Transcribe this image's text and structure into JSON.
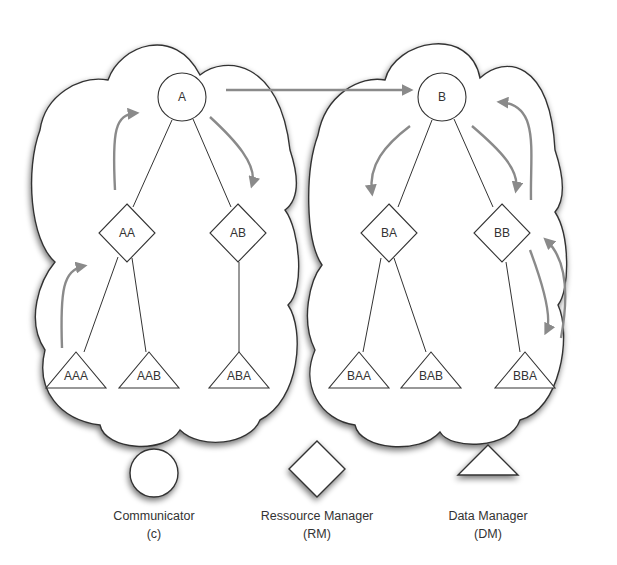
{
  "diagram": {
    "title": "",
    "clusters": [
      {
        "id": "cluster-A",
        "root": "A"
      },
      {
        "id": "cluster-B",
        "root": "B"
      }
    ],
    "nodes": [
      {
        "id": "A",
        "label": "A",
        "type": "communicator",
        "x": 182,
        "y": 97
      },
      {
        "id": "B",
        "label": "B",
        "type": "communicator",
        "x": 442,
        "y": 97
      },
      {
        "id": "AA",
        "label": "AA",
        "type": "resource-manager",
        "x": 127,
        "y": 233
      },
      {
        "id": "AB",
        "label": "AB",
        "type": "resource-manager",
        "x": 238,
        "y": 233
      },
      {
        "id": "BA",
        "label": "BA",
        "type": "resource-manager",
        "x": 389,
        "y": 233
      },
      {
        "id": "BB",
        "label": "BB",
        "type": "resource-manager",
        "x": 502,
        "y": 233
      },
      {
        "id": "AAA",
        "label": "AAA",
        "type": "data-manager",
        "x": 76,
        "y": 375
      },
      {
        "id": "AAB",
        "label": "AAB",
        "type": "data-manager",
        "x": 149,
        "y": 375
      },
      {
        "id": "ABA",
        "label": "ABA",
        "type": "data-manager",
        "x": 239,
        "y": 375
      },
      {
        "id": "BAA",
        "label": "BAA",
        "type": "data-manager",
        "x": 359,
        "y": 375
      },
      {
        "id": "BAB",
        "label": "BAB",
        "type": "data-manager",
        "x": 431,
        "y": 375
      },
      {
        "id": "BBA",
        "label": "BBA",
        "type": "data-manager",
        "x": 525,
        "y": 375
      }
    ],
    "edges": [
      [
        "A",
        "AA"
      ],
      [
        "A",
        "AB"
      ],
      [
        "AA",
        "AAA"
      ],
      [
        "AA",
        "AAB"
      ],
      [
        "AB",
        "ABA"
      ],
      [
        "B",
        "BA"
      ],
      [
        "B",
        "BB"
      ],
      [
        "BA",
        "BAA"
      ],
      [
        "BA",
        "BAB"
      ],
      [
        "BB",
        "BBA"
      ]
    ],
    "message_flow": [
      "AAA→AA",
      "AA→A",
      "A→AB",
      "A→B",
      "B→BA",
      "B→BB",
      "BB→BBA",
      "BBA→BB",
      "BB→B"
    ],
    "arrow_color": "#8a8a8a",
    "line_color": "#333333"
  },
  "legend": {
    "items": [
      {
        "shape": "circle",
        "label": "Communicator",
        "abbr": "(c)"
      },
      {
        "shape": "diamond",
        "label": "Ressource Manager",
        "abbr": "(RM)"
      },
      {
        "shape": "triangle",
        "label": "Data Manager",
        "abbr": "(DM)"
      }
    ]
  }
}
